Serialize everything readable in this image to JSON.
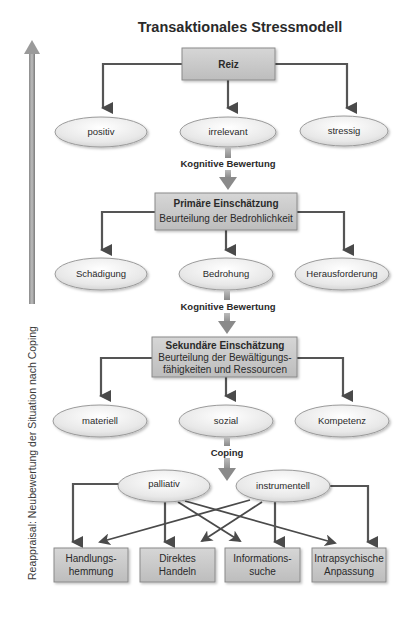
{
  "title": "Transaktionales Stressmodell",
  "side_label": "Reappraisal: Neubewertung der Situation nach Coping",
  "nodes": {
    "reiz": {
      "title": "Reiz"
    },
    "positiv": {
      "label": "positiv"
    },
    "irrelevant": {
      "label": "irrelevant"
    },
    "stressig": {
      "label": "stressig"
    },
    "primaer": {
      "title": "Primäre Einschätzung",
      "subtitle": "Beurteilung der Bedrohlichkeit"
    },
    "schaedigung": {
      "label": "Schädigung"
    },
    "bedrohung": {
      "label": "Bedrohung"
    },
    "herausforderung": {
      "label": "Herausforderung"
    },
    "sekundaer": {
      "title": "Sekundäre Einschätzung",
      "line1": "Beurteilung der Bewältigungs-",
      "line2": "fähigkeiten und Ressourcen"
    },
    "materiell": {
      "label": "materiell"
    },
    "sozial": {
      "label": "sozial"
    },
    "kompetenz": {
      "label": "Kompetenz"
    },
    "palliativ": {
      "label": "palliativ"
    },
    "instrumentell": {
      "label": "instrumentell"
    },
    "handlung": {
      "line1": "Handlungs-",
      "line2": "hemmung"
    },
    "direktes": {
      "line1": "Direktes",
      "line2": "Handeln"
    },
    "information": {
      "line1": "Informations-",
      "line2": "suche"
    },
    "intrapsych": {
      "line1": "Intrapsychische",
      "line2": "Anpassung"
    }
  },
  "transitions": {
    "t1": "Kognitive Bewertung",
    "t2": "Kognitive Bewertung",
    "t3": "Coping"
  },
  "colors": {
    "box_fill": "#c8c8c8",
    "ellipse_fill": "#ececec",
    "arrow": "#555555",
    "text": "#2a2a2a"
  }
}
